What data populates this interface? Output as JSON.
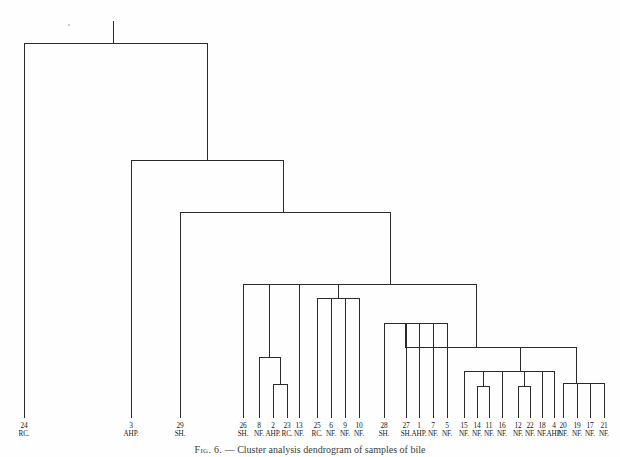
{
  "figure": {
    "caption_label": "Fig. 6.",
    "caption_dash": "—",
    "caption_text": "Cluster analysis dendrogram of samples of bile",
    "background_color": "#fefefe",
    "line_color": "#2a2a2a"
  },
  "chart_data": {
    "type": "dendrogram",
    "title": "Cluster analysis dendrogram of samples of bile",
    "xlabel": "",
    "ylabel": "",
    "orientation": "top-down",
    "grid": false,
    "legend": "none",
    "leaf_count": 29,
    "leaves": [
      {
        "id": "24",
        "code": "RC.",
        "x": 24
      },
      {
        "id": "3",
        "code": "AHP.",
        "x": 131
      },
      {
        "id": "29",
        "code": "SH.",
        "x": 180
      },
      {
        "id": "26",
        "code": "SH.",
        "x": 243
      },
      {
        "id": "8",
        "code": "NF.",
        "x": 259
      },
      {
        "id": "2",
        "code": "AHP.",
        "x": 273
      },
      {
        "id": "23",
        "code": "RC.",
        "x": 287
      },
      {
        "id": "13",
        "code": "NF.",
        "x": 299
      },
      {
        "id": "25",
        "code": "RC.",
        "x": 317
      },
      {
        "id": "6",
        "code": "NF.",
        "x": 331
      },
      {
        "id": "9",
        "code": "NF.",
        "x": 345
      },
      {
        "id": "10",
        "code": "NF.",
        "x": 359
      },
      {
        "id": "28",
        "code": "SH.",
        "x": 384
      },
      {
        "id": "27",
        "code": "SH.",
        "x": 406
      },
      {
        "id": "1",
        "code": "AHP.",
        "x": 419
      },
      {
        "id": "7",
        "code": "NF.",
        "x": 433
      },
      {
        "id": "5",
        "code": "NF.",
        "x": 447
      },
      {
        "id": "15",
        "code": "NF.",
        "x": 464
      },
      {
        "id": "14",
        "code": "NF.",
        "x": 477
      },
      {
        "id": "11",
        "code": "NF.",
        "x": 489
      },
      {
        "id": "16",
        "code": "NF.",
        "x": 502
      },
      {
        "id": "12",
        "code": "NF.",
        "x": 518
      },
      {
        "id": "22",
        "code": "NF.",
        "x": 530
      },
      {
        "id": "18",
        "code": "NF.",
        "x": 542
      },
      {
        "id": "4",
        "code": "AHP.",
        "x": 554
      },
      {
        "id": "20",
        "code": "NF.",
        "x": 563
      },
      {
        "id": "19",
        "code": "NF.",
        "x": 577
      },
      {
        "id": "17",
        "code": "NF.",
        "x": 590
      },
      {
        "id": "21",
        "code": "NF.",
        "x": 604
      }
    ],
    "leaf_baseline_y": 412,
    "root_top_y": 21,
    "merges": [
      {
        "name": "m_2_23",
        "x": 280,
        "y": 384,
        "left_x": 273,
        "left_y": 412,
        "right_x": 287,
        "right_y": 412
      },
      {
        "name": "m_8_2_23",
        "x": 269,
        "y": 357,
        "left_x": 259,
        "left_y": 412,
        "right_x": 280,
        "right_y": 384
      },
      {
        "name": "m_26_8_23_13",
        "x": 271,
        "y": 284,
        "left_x": 243,
        "left_y": 412,
        "right_x": 299,
        "right_y": 412,
        "extra_x": 269,
        "extra_y": 357
      },
      {
        "name": "m_25_6_9_10",
        "x": 338,
        "y": 298,
        "left_x": 317,
        "left_y": 412,
        "right_x": 359,
        "right_y": 412
      },
      {
        "name": "m_left_right",
        "x": 304,
        "y": 284,
        "left_x": 271,
        "left_y": 284,
        "right_x": 338,
        "right_y": 298
      },
      {
        "name": "m_27_1_7_5",
        "x": 426,
        "y": 323,
        "left_x": 406,
        "left_y": 412,
        "right_x": 447,
        "right_y": 412
      },
      {
        "name": "m_28_cluster",
        "x": 405,
        "y": 323,
        "left_x": 384,
        "left_y": 412,
        "right_x": 426,
        "right_y": 323
      },
      {
        "name": "m_14_11",
        "x": 483,
        "y": 386,
        "left_x": 477,
        "left_y": 412,
        "right_x": 489,
        "right_y": 412
      },
      {
        "name": "m_12_22",
        "x": 524,
        "y": 386,
        "left_x": 518,
        "left_y": 412,
        "right_x": 530,
        "right_y": 412
      },
      {
        "name": "m_15_16_18",
        "x": 503,
        "y": 371,
        "left_x": 464,
        "left_y": 412,
        "right_x": 542,
        "right_y": 412
      },
      {
        "name": "m_plus_4",
        "x": 520,
        "y": 371,
        "left_x": 503,
        "left_y": 371,
        "right_x": 554,
        "right_y": 412
      },
      {
        "name": "m_20_19_17_21",
        "x": 576,
        "y": 383,
        "left_x": 563,
        "left_y": 412,
        "right_x": 604,
        "right_y": 412
      },
      {
        "name": "m_right_pair",
        "x": 548,
        "y": 347,
        "left_x": 520,
        "left_y": 371,
        "right_x": 576,
        "right_y": 383
      },
      {
        "name": "m_mid_right",
        "x": 476,
        "y": 347,
        "left_x": 405,
        "left_y": 323,
        "right_x": 548,
        "right_y": 347
      },
      {
        "name": "m_bigmid",
        "x": 390,
        "y": 284,
        "left_x": 304,
        "left_y": 284,
        "right_x": 476,
        "right_y": 347
      },
      {
        "name": "m_29_bigmid",
        "x": 283,
        "y": 212,
        "left_x": 180,
        "left_y": 412,
        "right_x": 390,
        "right_y": 284
      },
      {
        "name": "m_3_upper",
        "x": 207,
        "y": 160,
        "left_x": 131,
        "left_y": 412,
        "right_x": 283,
        "right_y": 212
      },
      {
        "name": "m_root",
        "x": 113,
        "y": 43,
        "left_x": 24,
        "left_y": 412,
        "right_x": 207,
        "right_y": 160
      }
    ]
  }
}
